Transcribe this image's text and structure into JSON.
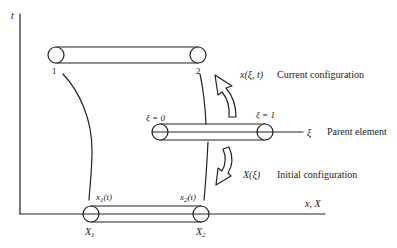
{
  "figure": {
    "axes": {
      "vertical_label": "t",
      "horizontal_label": "x, X"
    },
    "current_configuration": {
      "node_left_label": "1",
      "node_right_label": "2",
      "mapping_label": "x(ξ, t)",
      "description": "Current configuration"
    },
    "parent_element": {
      "left_label": "ξ = 0",
      "right_label": "ξ = 1",
      "axis_label": "ξ",
      "description": "Parent element"
    },
    "initial_configuration": {
      "mapping_label": "X(ξ)",
      "description": "Initial configuration",
      "node_left_trajectory": "x",
      "node_left_trajectory_sub": "1",
      "node_left_trajectory_arg": "(t)",
      "node_right_trajectory": "x",
      "node_right_trajectory_sub": "2",
      "node_right_trajectory_arg": "(t)",
      "node_left_material": "X",
      "node_left_material_sub": "1",
      "node_right_material": "X",
      "node_right_material_sub": "2"
    },
    "colors": {
      "stroke": "#222222",
      "background": "#ffffff"
    }
  }
}
